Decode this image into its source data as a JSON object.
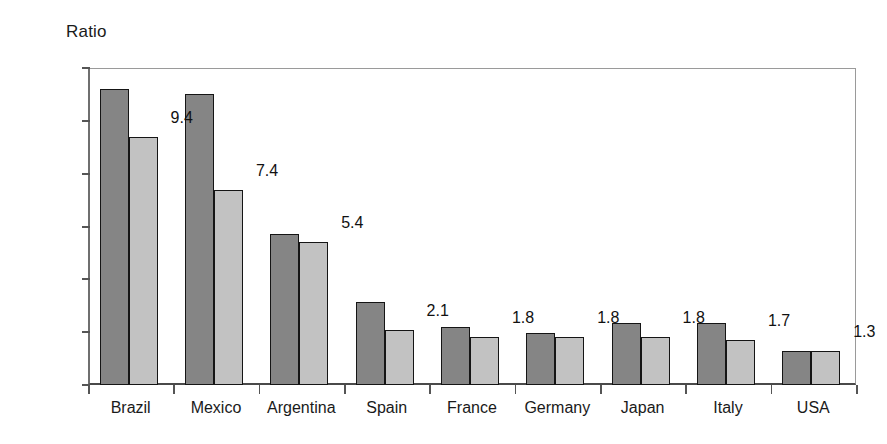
{
  "chart_data": {
    "type": "bar",
    "title": "",
    "ylabel": "Ratio",
    "xlabel": "",
    "ylim": [
      0,
      12
    ],
    "ytick_labels": [
      "12.0",
      "10.0",
      "8.0",
      "6.0",
      "4.0",
      "2.0",
      "-"
    ],
    "ytick_values": [
      12,
      10,
      8,
      6,
      4,
      2,
      0
    ],
    "grid": false,
    "legend": "none",
    "categories": [
      "Brazil",
      "Mexico",
      "Argentina",
      "Spain",
      "France",
      "Germany",
      "Japan",
      "Italy",
      "USA"
    ],
    "series": [
      {
        "name": "series-1",
        "color": "#858585",
        "labels_shown": false,
        "values": [
          11.2,
          11.0,
          5.7,
          3.15,
          2.2,
          1.95,
          2.35,
          2.35,
          1.3
        ]
      },
      {
        "name": "series-2",
        "color": "#c2c2c2",
        "labels_shown": true,
        "values": [
          9.4,
          7.4,
          5.4,
          2.1,
          1.8,
          1.8,
          1.8,
          1.7,
          1.3
        ],
        "data_labels": [
          "9.4",
          "7.4",
          "5.4",
          "2.1",
          "1.8",
          "1.8",
          "1.8",
          "1.7",
          "1.3"
        ]
      }
    ]
  },
  "colors": {
    "series1": "#858585",
    "series2": "#c2c2c2",
    "bar_border": "#151515",
    "axis": "#555555",
    "frame": "#9a9a9a",
    "text": "#1a1a1a",
    "background": "#ffffff"
  }
}
